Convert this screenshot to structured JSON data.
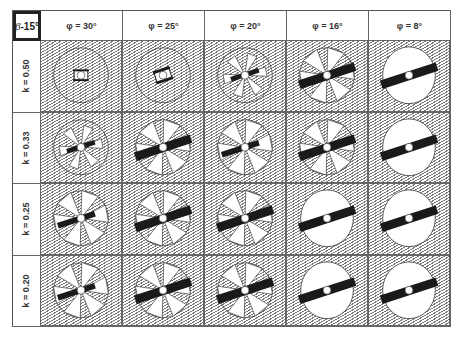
{
  "corner": {
    "symbol": "β",
    "label": "-15°"
  },
  "columns": [
    {
      "label": "φ = 30°"
    },
    {
      "label": "φ = 25°"
    },
    {
      "label": "φ = 20°"
    },
    {
      "label": "φ = 16°"
    },
    {
      "label": "φ = 8°"
    }
  ],
  "rows": [
    {
      "label": "k = 0.50"
    },
    {
      "label": "k = 0.33"
    },
    {
      "label": "k = 0.25"
    },
    {
      "label": "k = 0.20"
    }
  ],
  "cells": [
    [
      "small-core",
      "small-core-bar",
      "star-partial",
      "star-bar",
      "full-bar"
    ],
    [
      "star-partial",
      "star-bar",
      "star-full",
      "star-bar",
      "full-bar"
    ],
    [
      "star-full",
      "star-bar",
      "star-bar",
      "full-bar",
      "full-bar"
    ],
    [
      "star-full",
      "star-bar",
      "star-bar",
      "full-bar",
      "full-bar"
    ]
  ],
  "colors": {
    "hatch": "#7a7a7a",
    "ink": "#1a1a1a",
    "border": "#555555",
    "background": "#ffffff"
  }
}
